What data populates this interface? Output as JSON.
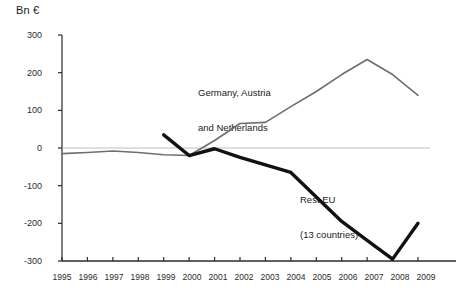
{
  "chart_data": {
    "type": "line",
    "title": "Bn €",
    "xlabel": "",
    "ylabel": "Bn €",
    "categories": [
      "1995",
      "1996",
      "1997",
      "1998",
      "1999",
      "2000",
      "2001",
      "2002",
      "2003",
      "2004",
      "2005",
      "2006",
      "2007",
      "2008",
      "2009"
    ],
    "x": [
      1995,
      1996,
      1997,
      1998,
      1999,
      2000,
      2001,
      2002,
      2003,
      2004,
      2005,
      2006,
      2007,
      2008,
      2009
    ],
    "ylim": [
      -300,
      300
    ],
    "xlim": [
      1995,
      2009
    ],
    "yticks": [
      300,
      200,
      100,
      0,
      -100,
      -200,
      -300
    ],
    "ytick_labels": [
      "300",
      "200",
      "100",
      "0",
      "-100",
      "-200",
      "-300"
    ],
    "grid": false,
    "zero_line": true,
    "legend": "inline-annotations",
    "series": [
      {
        "name": "Germany, Austria and Netherlands",
        "color": "#6e6e6e",
        "width": 1.6,
        "x": [
          1995,
          1996,
          1997,
          1998,
          1999,
          2000,
          2001,
          2002,
          2003,
          2004,
          2005,
          2006,
          2007,
          2008,
          2009
        ],
        "values": [
          -15,
          -12,
          -8,
          -12,
          -18,
          -20,
          20,
          65,
          68,
          110,
          150,
          195,
          235,
          195,
          140
        ]
      },
      {
        "name": "Rest EU (13 countries)",
        "color": "#111111",
        "width": 3.4,
        "x": [
          1999,
          2000,
          2001,
          2002,
          2003,
          2004,
          2005,
          2006,
          2007,
          2008,
          2009
        ],
        "values": [
          35,
          -20,
          -2,
          -25,
          -45,
          -65,
          -130,
          -195,
          -245,
          -295,
          -200
        ]
      }
    ],
    "annotations": [
      {
        "name": "germany-austria-netherlands-label",
        "text": "Germany, Austria\nand Netherlands",
        "line1": "Germany, Austria",
        "line2": "and Netherlands",
        "x_px": 198,
        "y_px": 64
      },
      {
        "name": "rest-eu-label",
        "text": "Rest EU\n(13 countries)",
        "line1": "Rest EU",
        "line2": "(13 countries)",
        "x_px": 300,
        "y_px": 171
      }
    ]
  },
  "axes": {
    "unit_title": "Bn €",
    "y_labels": [
      "300",
      "200",
      "100",
      "0",
      "-100",
      "-200",
      "-300"
    ],
    "x_labels": [
      "1995",
      "1996",
      "1997",
      "1998",
      "1999",
      "2000",
      "2001",
      "2002",
      "2003",
      "2004",
      "2005",
      "2006",
      "2007",
      "2008",
      "2009"
    ]
  },
  "series_labels": {
    "gray_line1": "Germany, Austria",
    "gray_line2": "and Netherlands",
    "black_line1": "Rest EU",
    "black_line2": "(13 countries)"
  },
  "colors": {
    "gray_series": "#6e6e6e",
    "black_series": "#111111",
    "axis": "#2b2b2b",
    "zero_line": "#b8b8b8",
    "background": "#ffffff"
  }
}
